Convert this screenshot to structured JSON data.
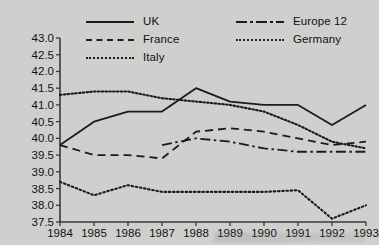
{
  "chart_data": {
    "type": "line",
    "title": "",
    "subtitle": "",
    "xlabel": "",
    "ylabel": "",
    "categories": [
      1984,
      1985,
      1986,
      1987,
      1988,
      1989,
      1990,
      1991,
      1992,
      1993
    ],
    "xtick_labels": [
      "1984",
      "1985",
      "1986",
      "1987",
      "1988",
      "1989",
      "1990",
      "1991",
      "1992",
      "1993"
    ],
    "ytick_labels": [
      "43.0",
      "42.5",
      "42.0",
      "41.5",
      "41.0",
      "40.5",
      "40.0",
      "39.5",
      "39.0",
      "38.5",
      "38.0",
      "37.5"
    ],
    "ytick_values": [
      43.0,
      42.5,
      42.0,
      41.5,
      41.0,
      40.5,
      40.0,
      39.5,
      39.0,
      38.5,
      38.0,
      37.5
    ],
    "ylim": [
      37.5,
      43.0
    ],
    "xlim": [
      1984,
      1993
    ],
    "grid": false,
    "legend_position": "top",
    "series": [
      {
        "name": "UK",
        "style": "solid",
        "color": "#1b1b1b",
        "x": [
          1984,
          1985,
          1986,
          1987,
          1988,
          1989,
          1990,
          1991,
          1992,
          1993
        ],
        "values": [
          39.8,
          40.5,
          40.8,
          40.8,
          41.5,
          41.1,
          41.0,
          41.0,
          40.4,
          41.0
        ]
      },
      {
        "name": "Europe 12",
        "style": "dashdot",
        "color": "#1b1b1b",
        "x": [
          1987,
          1988,
          1989,
          1990,
          1991,
          1992,
          1993
        ],
        "values": [
          39.8,
          40.0,
          39.9,
          39.7,
          39.6,
          39.6,
          39.6
        ]
      },
      {
        "name": "France",
        "style": "dashed",
        "color": "#1b1b1b",
        "x": [
          1984,
          1985,
          1986,
          1987,
          1988,
          1989,
          1990,
          1991,
          1992,
          1993
        ],
        "values": [
          39.8,
          39.5,
          39.5,
          39.4,
          40.2,
          40.3,
          40.2,
          40.0,
          39.8,
          39.9
        ]
      },
      {
        "name": "Germany",
        "style": "dotted-fine",
        "color": "#1b1b1b",
        "x": [
          1984,
          1985,
          1986,
          1987,
          1988,
          1989,
          1990,
          1991,
          1992,
          1993
        ],
        "values": [
          41.3,
          41.4,
          41.4,
          41.2,
          41.1,
          41.0,
          40.8,
          40.4,
          39.9,
          39.7
        ]
      },
      {
        "name": "Italy",
        "style": "dotted",
        "color": "#1b1b1b",
        "x": [
          1984,
          1985,
          1986,
          1987,
          1988,
          1989,
          1990,
          1991,
          1992,
          1993
        ],
        "values": [
          38.7,
          38.3,
          38.6,
          38.4,
          38.4,
          38.4,
          38.4,
          38.45,
          37.6,
          38.0
        ]
      }
    ]
  },
  "legend": {
    "rows": [
      [
        {
          "label": "UK",
          "style": "solid"
        },
        {
          "label": "Europe 12",
          "style": "dashdot"
        }
      ],
      [
        {
          "label": "France",
          "style": "dashed"
        },
        {
          "label": "Germany",
          "style": "dotted-fine"
        }
      ],
      [
        {
          "label": "Italy",
          "style": "dotted"
        }
      ]
    ]
  },
  "axis": {
    "y_axis_name": "y-axis",
    "x_axis_name": "x-axis"
  }
}
